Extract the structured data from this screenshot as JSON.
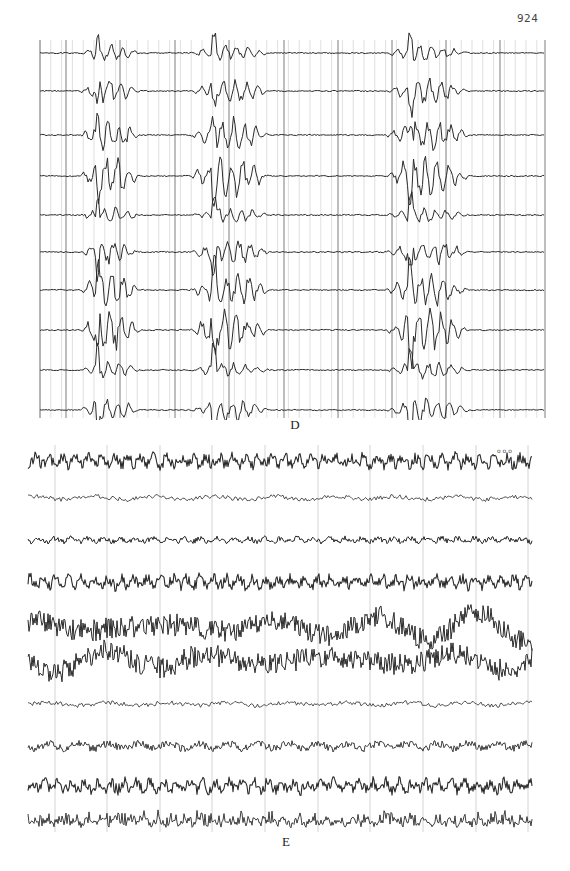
{
  "figure": {
    "page_number": "924",
    "panels": [
      {
        "id": "D",
        "label": "D",
        "trace_count": 11,
        "grid": {
          "x_start": 40,
          "x_end": 545,
          "y_start": 40,
          "y_end": 418,
          "major_x": [
            40,
            66,
            120,
            175,
            229,
            284,
            338,
            392,
            446,
            500,
            545
          ],
          "minor_step": 10.8
        },
        "trace_baselines": [
          53,
          91,
          135,
          176,
          215,
          252,
          290,
          330,
          370,
          410
        ],
        "discharge_windows": [
          [
            80,
            140
          ],
          [
            190,
            270
          ],
          [
            385,
            470
          ]
        ],
        "description": "Multichannel EEG with synchronous bursts of polyspike/sharp-wave discharges separated by flat intervals"
      },
      {
        "id": "E",
        "label": "E",
        "trace_count": 10,
        "grid": {
          "x_start": 28,
          "x_end": 532,
          "major_x": [
            55,
            107,
            160,
            212,
            265,
            318,
            370,
            423,
            476,
            528
          ]
        },
        "trace_baselines": [
          461,
          498,
          540,
          582,
          627,
          660,
          704,
          746,
          786,
          822
        ],
        "trace_styles": [
          "dense-fast",
          "low-slow",
          "low-fast",
          "dense-fast",
          "high-slow",
          "high-slow",
          "low-slow",
          "medium",
          "dense-fast",
          "spiky-low"
        ],
        "annotation": "o o o",
        "description": "Multichannel EEG with continuous mixed-frequency activity; channels 5–6 show high-amplitude slow waves"
      }
    ]
  },
  "colors": {
    "trace": "#2a2a2a",
    "grid_major": "#6e6e6e",
    "grid_minor": "#c9c9c9",
    "background": "#ffffff"
  }
}
